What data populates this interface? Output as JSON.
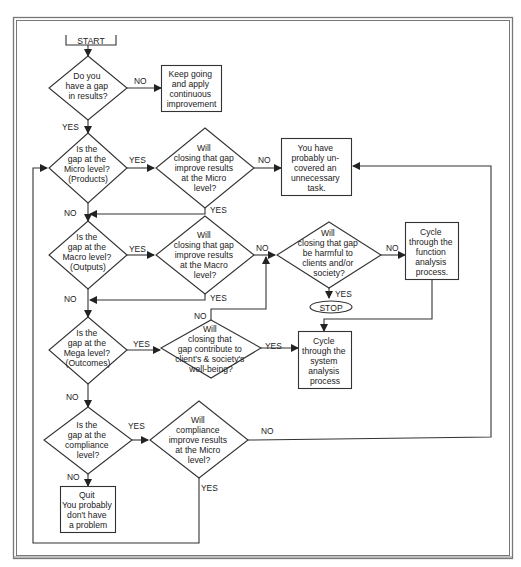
{
  "flowchart": {
    "start": "START",
    "stop": "STOP",
    "nodes": {
      "q_gap": [
        "Do you",
        "have a gap",
        "in results?"
      ],
      "keep_going": [
        "Keep going",
        "and apply",
        "continuous",
        "improvement"
      ],
      "q_micro": [
        "Is the",
        "gap at the",
        "Micro level?",
        "(Products)"
      ],
      "q_improve_micro": [
        "Will",
        "closing that gap",
        "improve results",
        "at the Micro",
        "level?"
      ],
      "unnecessary_task": [
        "You have",
        "probably un-",
        "covered an",
        "unnecessary",
        "task."
      ],
      "q_macro": [
        "Is the",
        "gap at the",
        "Macro level?",
        "(Outputs)"
      ],
      "q_improve_macro": [
        "Will",
        "closing that gap",
        "improve results",
        "at the Macro",
        "level?"
      ],
      "q_harmful": [
        "Will",
        "closing that gap",
        "be harmful to",
        "clients and/or",
        "society?"
      ],
      "function_analysis": [
        "Cycle",
        "through the",
        "function",
        "analysis",
        "process."
      ],
      "q_mega": [
        "Is the",
        "gap at the",
        "Mega level?",
        "(Outcomes)"
      ],
      "q_wellbeing": [
        "Will",
        "closing that",
        "gap contribute to",
        "client's & society's",
        "well-being?"
      ],
      "system_analysis": [
        "Cycle",
        "through the",
        "system",
        "analysis",
        "process"
      ],
      "q_compliance": [
        "Is the",
        "gap at the",
        "compliance",
        "level?"
      ],
      "q_compliance_improve": [
        "Will",
        "compliance",
        "improve results",
        "at the Micro",
        "level?"
      ],
      "quit": [
        "Quit",
        "You probably",
        "don't have",
        "a problem"
      ]
    },
    "edge_labels": {
      "yes": "YES",
      "no": "NO"
    }
  }
}
